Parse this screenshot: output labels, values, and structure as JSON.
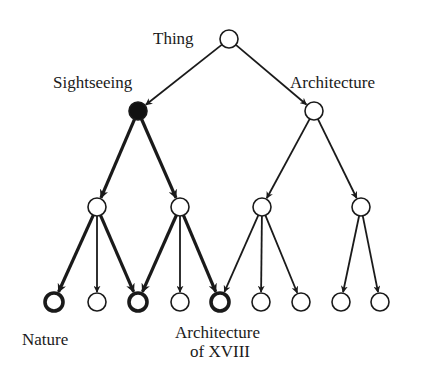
{
  "diagram": {
    "type": "tree",
    "labels": {
      "root": "Thing",
      "sightseeing": "Sightseeing",
      "architecture": "Architecture",
      "nature": "Nature",
      "arch_xviii_line1": "Architecture",
      "arch_xviii_line2": "of XVIII"
    },
    "nodes": [
      {
        "id": "thing",
        "x": 229,
        "y": 39,
        "style": "plain",
        "label": "Thing"
      },
      {
        "id": "sightseeing",
        "x": 138,
        "y": 111,
        "style": "filled",
        "label": "Sightseeing"
      },
      {
        "id": "architecture",
        "x": 314,
        "y": 111,
        "style": "plain",
        "label": "Architecture"
      },
      {
        "id": "s1",
        "x": 97,
        "y": 207,
        "style": "plain"
      },
      {
        "id": "s2",
        "x": 180,
        "y": 207,
        "style": "plain"
      },
      {
        "id": "a1",
        "x": 262,
        "y": 207,
        "style": "plain"
      },
      {
        "id": "a2",
        "x": 361,
        "y": 207,
        "style": "plain"
      },
      {
        "id": "l1",
        "x": 54,
        "y": 302,
        "style": "bold",
        "label": "Nature"
      },
      {
        "id": "l2",
        "x": 97,
        "y": 302,
        "style": "plain"
      },
      {
        "id": "l3",
        "x": 138,
        "y": 302,
        "style": "bold"
      },
      {
        "id": "l4",
        "x": 180,
        "y": 302,
        "style": "plain"
      },
      {
        "id": "l5",
        "x": 220,
        "y": 302,
        "style": "bold",
        "label": "Architecture of XVIII"
      },
      {
        "id": "l6",
        "x": 261,
        "y": 302,
        "style": "plain"
      },
      {
        "id": "l7",
        "x": 301,
        "y": 302,
        "style": "plain"
      },
      {
        "id": "l8",
        "x": 341,
        "y": 302,
        "style": "plain"
      },
      {
        "id": "l9",
        "x": 380,
        "y": 302,
        "style": "plain"
      }
    ],
    "edges": [
      {
        "from": "thing",
        "to": "sightseeing",
        "bold": false
      },
      {
        "from": "thing",
        "to": "architecture",
        "bold": false
      },
      {
        "from": "sightseeing",
        "to": "s1",
        "bold": true
      },
      {
        "from": "sightseeing",
        "to": "s2",
        "bold": true
      },
      {
        "from": "architecture",
        "to": "a1",
        "bold": false
      },
      {
        "from": "architecture",
        "to": "a2",
        "bold": false
      },
      {
        "from": "s1",
        "to": "l1",
        "bold": true
      },
      {
        "from": "s1",
        "to": "l2",
        "bold": false
      },
      {
        "from": "s1",
        "to": "l3",
        "bold": true
      },
      {
        "from": "s2",
        "to": "l3",
        "bold": true
      },
      {
        "from": "s2",
        "to": "l4",
        "bold": false
      },
      {
        "from": "s2",
        "to": "l5",
        "bold": true
      },
      {
        "from": "a1",
        "to": "l5",
        "bold": false
      },
      {
        "from": "a1",
        "to": "l6",
        "bold": false
      },
      {
        "from": "a1",
        "to": "l7",
        "bold": false
      },
      {
        "from": "a2",
        "to": "l8",
        "bold": false
      },
      {
        "from": "a2",
        "to": "l9",
        "bold": false
      }
    ],
    "colors": {
      "stroke": "#1a1a1a",
      "fill": "#ffffff",
      "filled": "#111111"
    }
  }
}
